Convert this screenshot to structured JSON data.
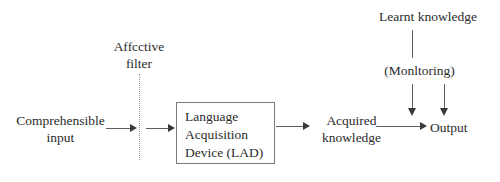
{
  "diagram": {
    "background_color": "#ffffff",
    "text_color": "#2b2b2b",
    "line_color": "#5e5e5e",
    "box_border_color": "#7a7a7a",
    "dotted_line_color": "#9a9a9a"
  },
  "labels": {
    "affective_filter_line1": "Affcctive",
    "affective_filter_line2": "filter",
    "comprehensible_input_line1": "Comprehensible",
    "comprehensible_input_line2": "input",
    "lad_line1": "Language",
    "lad_line2": "Acquisition",
    "lad_line3": "Device (LAD)",
    "acquired_knowledge_line1": "Acquired",
    "acquired_knowledge_line2": "knowledge",
    "learnt_knowledge": "Learnt knowledge",
    "monitoring": "(Monltoring)",
    "output": "Output"
  },
  "nodes": [
    {
      "id": "comprehensible-input",
      "text": "Comprehensible input",
      "type": "text-node"
    },
    {
      "id": "affective-filter",
      "text": "Affcctive filter",
      "type": "barrier-label"
    },
    {
      "id": "language-acquisition-device",
      "text": "Language Acquisition Device (LAD)",
      "type": "box"
    },
    {
      "id": "acquired-knowledge",
      "text": "Acquired knowledge",
      "type": "text-node"
    },
    {
      "id": "learnt-knowledge",
      "text": "Learnt knowledge",
      "type": "text-node"
    },
    {
      "id": "monitoring",
      "text": "(Monltoring)",
      "type": "text-node"
    },
    {
      "id": "output",
      "text": "Output",
      "type": "text-node"
    }
  ],
  "connectors": [
    {
      "from": "comprehensible-input",
      "to": "affective-filter",
      "style": "arrow-right"
    },
    {
      "from": "affective-filter",
      "to": "language-acquisition-device",
      "style": "arrow-right"
    },
    {
      "from": "language-acquisition-device",
      "to": "acquired-knowledge",
      "style": "arrow-right"
    },
    {
      "from": "acquired-knowledge",
      "to": "output",
      "style": "arrow-right"
    },
    {
      "from": "learnt-knowledge",
      "to": "monitoring",
      "style": "line-down"
    },
    {
      "from": "monitoring",
      "to": "output-line",
      "style": "arrow-down"
    },
    {
      "from": "learnt-knowledge",
      "to": "output-line",
      "style": "arrow-down"
    }
  ]
}
